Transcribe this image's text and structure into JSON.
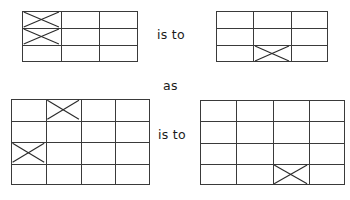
{
  "page": {
    "background": "#ffffff",
    "line_color": "#3a3a3a",
    "mark_color": "#2b2b2b",
    "text_color": "#1a1a1a",
    "width": 350,
    "height": 200
  },
  "connectors": {
    "is_to_top": "is to",
    "as": "as",
    "is_to_bottom": "is to"
  },
  "figures": [
    {
      "id": "figure-a",
      "role": "analogy-term-a",
      "position": "top-left",
      "x": 22,
      "y": 11,
      "width": 116,
      "height": 51,
      "columns": 3,
      "rows": 3,
      "marks": [
        {
          "symbol": "X",
          "row": 1,
          "col": 1
        },
        {
          "symbol": "X",
          "row": 2,
          "col": 1
        }
      ],
      "mark_count": 2
    },
    {
      "id": "figure-b",
      "role": "analogy-term-b",
      "position": "top-right",
      "x": 216,
      "y": 11,
      "width": 112,
      "height": 51,
      "columns": 3,
      "rows": 3,
      "marks": [
        {
          "symbol": "X",
          "row": 3,
          "col": 2
        }
      ],
      "mark_count": 1
    },
    {
      "id": "figure-c",
      "role": "analogy-term-c",
      "position": "bottom-left",
      "x": 11,
      "y": 99,
      "width": 139,
      "height": 86,
      "columns": 4,
      "rows": 4,
      "marks": [
        {
          "symbol": "X",
          "row": 1,
          "col": 2
        },
        {
          "symbol": "X",
          "row": 3,
          "col": 1
        }
      ],
      "mark_count": 2
    },
    {
      "id": "figure-d",
      "role": "analogy-term-d",
      "position": "bottom-right",
      "x": 200,
      "y": 100,
      "width": 145,
      "height": 85,
      "columns": 4,
      "rows": 4,
      "marks": [
        {
          "symbol": "X",
          "row": 4,
          "col": 3
        }
      ],
      "mark_count": 1
    }
  ]
}
